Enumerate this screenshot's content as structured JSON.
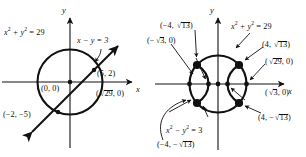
{
  "figure": {
    "type": "math-graph-pair"
  },
  "panels": [
    {
      "id": "left",
      "name": "circle-line-system",
      "axes": {
        "x_label": "x",
        "y_label": "y"
      },
      "curves": [
        {
          "name": "circle",
          "equation_html": "x<sup>2</sup> + y<sup>2</sup> = 29",
          "equation_text": "x^2 + y^2 = 29",
          "radius": 5.385
        },
        {
          "name": "line",
          "equation_html": "x &minus; y = 3",
          "equation_text": "x - y = 3",
          "slope": 1,
          "intercept": -3
        }
      ],
      "points": [
        {
          "label": "(0, 0)",
          "role": "origin",
          "x": 0,
          "y": 0
        },
        {
          "label": "(5, 2)",
          "role": "intersection",
          "x": 5,
          "y": 2
        },
        {
          "label": "(√29, 0)",
          "role": "x-intercept-circle",
          "x": 5.385,
          "y": 0
        },
        {
          "label": "(−2, −5)",
          "role": "intersection",
          "x": -2,
          "y": -5
        }
      ]
    },
    {
      "id": "right",
      "name": "circle-hyperbola-system",
      "axes": {
        "x_label": "x",
        "y_label": "y"
      },
      "curves": [
        {
          "name": "circle",
          "equation_html": "x<sup>2</sup> + y<sup>2</sup> = 29",
          "equation_text": "x^2 + y^2 = 29",
          "radius": 5.385
        },
        {
          "name": "hyperbola",
          "equation_html": "x<sup>2</sup> &minus; y<sup>2</sup> = 3",
          "equation_text": "x^2 - y^2 = 3",
          "a": 1.732
        }
      ],
      "points": [
        {
          "label": "(−4, √13)",
          "role": "intersection",
          "x": -4,
          "y": 3.606
        },
        {
          "label": "(4, √13)",
          "role": "intersection",
          "x": 4,
          "y": 3.606
        },
        {
          "label": "(−4, −√13)",
          "role": "intersection",
          "x": -4,
          "y": -3.606
        },
        {
          "label": "(4, −√13)",
          "role": "intersection",
          "x": 4,
          "y": -3.606
        },
        {
          "label": "(−√3, 0)",
          "role": "hyperbola-vertex",
          "x": -1.732,
          "y": 0
        },
        {
          "label": "(√3, 0)",
          "role": "hyperbola-vertex",
          "x": 1.732,
          "y": 0
        },
        {
          "label": "(√29, 0)",
          "role": "x-intercept-circle",
          "x": 5.385,
          "y": 0
        }
      ]
    }
  ],
  "labels": {
    "left": {
      "circle_eq": {
        "pre": "x",
        "sup1": "2",
        "mid": " + y",
        "sup2": "2",
        "post": " = 29"
      },
      "line_eq": {
        "text": "x − y = 3"
      },
      "origin": "(0, 0)",
      "pt_5_2": "(5, 2)",
      "pt_sqrt29": {
        "open": "(",
        "rad": "29",
        "close": ", 0)"
      },
      "pt_neg2_neg5": "(−2, −5)",
      "axis_x": "x",
      "axis_y": "y"
    },
    "right": {
      "circle_eq": {
        "pre": "x",
        "sup1": "2",
        "mid": " + y",
        "sup2": "2",
        "post": " = 29"
      },
      "hyperbola_eq": {
        "pre": "x",
        "sup1": "2",
        "mid": " − y",
        "sup2": "2",
        "post": " = 3"
      },
      "pt_neg4_sqrt13": {
        "open": "(−4, ",
        "rad": "13",
        "close": ")"
      },
      "pt_4_sqrt13": {
        "open": "(4, ",
        "rad": "13",
        "close": ")"
      },
      "pt_neg4_negsqrt13": {
        "open": "(−4, −",
        "rad": "13",
        "close": ")"
      },
      "pt_4_negsqrt13": {
        "open": "(4, −",
        "rad": "13",
        "close": ")"
      },
      "pt_negsqrt3": {
        "open": "(−",
        "rad": "3",
        "close": ", 0)"
      },
      "pt_sqrt3": {
        "open": "(",
        "rad": "3",
        "close": ", 0)"
      },
      "pt_sqrt29": {
        "open": "(",
        "rad": "29",
        "close": ", 0)"
      },
      "axis_x": "x",
      "axis_y": "y"
    }
  },
  "colors": {
    "ink": "#111111",
    "background": "#ffffff",
    "curve": "#000000"
  }
}
